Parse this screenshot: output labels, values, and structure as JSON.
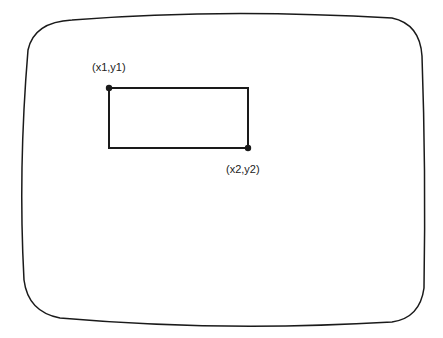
{
  "diagram": {
    "type": "screen-rectangle-coordinates",
    "screen": {
      "shape": "rounded-crt-screen"
    },
    "rectangle": {
      "corner1": {
        "label": "(x1,y1)",
        "x": 109,
        "y": 88
      },
      "corner2": {
        "label": "(x2,y2)",
        "x": 248,
        "y": 148
      }
    },
    "colors": {
      "stroke": "#1a1a1a",
      "background": "#ffffff"
    }
  }
}
